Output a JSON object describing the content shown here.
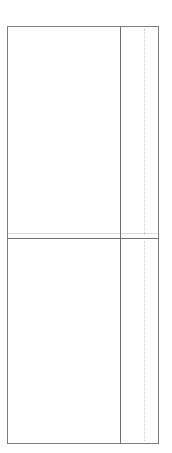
{
  "document": {
    "title": "Wireframe Panel Layout",
    "background_color": "#ffffff",
    "width": 172,
    "height": 453
  },
  "frame": {
    "name": "outer-frame",
    "border_color": "#7d7d7d",
    "fill_color": "#ffffff",
    "x": 7,
    "y": 26,
    "width": 152,
    "height": 418,
    "label": ""
  },
  "dividers": {
    "horizontal": {
      "label": "",
      "color": "#6f6f6f",
      "y": 237,
      "orientation": "horizontal",
      "style": "solid"
    },
    "horizontal_hairline": {
      "label": "",
      "color": "#dcdcdc",
      "y": 232,
      "orientation": "horizontal",
      "style": "solid"
    },
    "vertical": {
      "label": "",
      "color": "#6f6f6f",
      "x": 119,
      "orientation": "vertical",
      "style": "solid"
    }
  },
  "guides": [
    {
      "label": "",
      "color": "#c9c9c9",
      "x": 143,
      "orientation": "vertical",
      "style": "dotted",
      "segment": "upper"
    },
    {
      "label": "",
      "color": "#c9c9c9",
      "x": 143,
      "orientation": "vertical",
      "style": "dotted",
      "segment": "lower"
    }
  ],
  "panels": [
    {
      "name": "upper-main-panel",
      "label": "",
      "fill_color": "#ffffff"
    },
    {
      "name": "upper-side-panel",
      "label": "",
      "fill_color": "#ffffff"
    },
    {
      "name": "lower-main-panel",
      "label": "",
      "fill_color": "#ffffff"
    },
    {
      "name": "lower-side-panel",
      "label": "",
      "fill_color": "#ffffff"
    }
  ]
}
